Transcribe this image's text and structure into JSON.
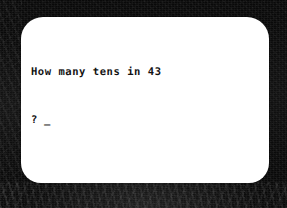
{
  "device": {
    "type": "crt-monitor",
    "bezel_color": "#090909",
    "screen_color": "#ffffff",
    "text_color": "#121212"
  },
  "screen": {
    "program_type": "text-console-math-quiz",
    "lines": [
      {
        "id": "question",
        "text": "How many tens in 43"
      },
      {
        "id": "prompt",
        "text": "?",
        "cursor": "_"
      }
    ],
    "question_text": "How many tens in 43",
    "prompt_symbol": "?",
    "cursor_glyph": "_",
    "input_value": ""
  }
}
